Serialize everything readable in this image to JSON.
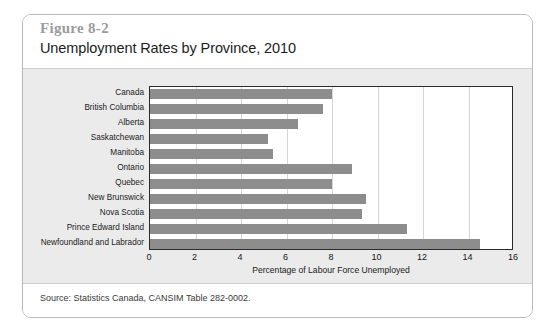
{
  "figure": {
    "number": "Figure 8-2",
    "title": "Unemployment Rates by Province, 2010",
    "source": "Source: Statistics Canada, CANSIM Table 282-0002."
  },
  "chart_data": {
    "type": "bar",
    "orientation": "horizontal",
    "title": "Unemployment Rates by Province, 2010",
    "xlabel": "Percentage of Labour Force Unemployed",
    "ylabel": "",
    "xlim": [
      0,
      16
    ],
    "xticks": [
      0,
      2,
      4,
      6,
      8,
      10,
      12,
      14,
      16
    ],
    "gridlines": "vertical at every tick",
    "legend": "none",
    "bar_color": "#8d8d8d",
    "plot_background": "#ffffff",
    "panel_background": "#ebebeb",
    "categories": [
      "Canada",
      "British Columbia",
      "Alberta",
      "Saskatchewan",
      "Manitoba",
      "Ontario",
      "Quebec",
      "New Brunswick",
      "Nova Scotia",
      "Prince Edward Island",
      "Newfoundland and Labrador"
    ],
    "values": [
      8.0,
      7.6,
      6.5,
      5.2,
      5.4,
      8.9,
      8.0,
      9.5,
      9.3,
      11.3,
      14.5
    ]
  }
}
